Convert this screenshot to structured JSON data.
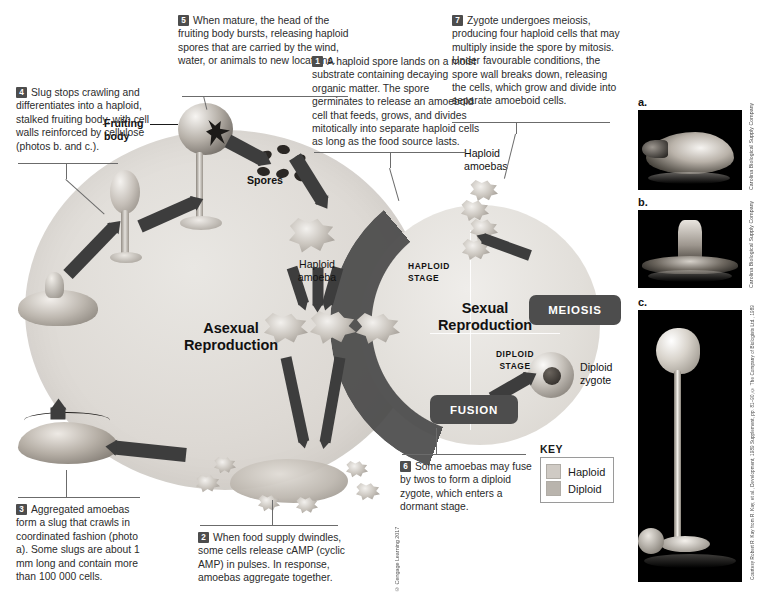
{
  "figure": {
    "asexual_label": "Asexual\nReproduction",
    "asexual_line1": "Asexual",
    "asexual_line2": "Reproduction",
    "sexual_line1": "Sexual",
    "sexual_line2": "Reproduction",
    "haploid_stage_line1": "HAPLOID",
    "haploid_stage_line2": "STAGE",
    "diploid_stage_line1": "DIPLOID",
    "diploid_stage_line2": "STAGE",
    "meiosis_pill": "MEIOSIS",
    "fusion_pill": "FUSION"
  },
  "labels": {
    "fruiting_body_line1": "Fruiting",
    "fruiting_body_line2": "body",
    "spores": "Spores",
    "haploid_amoeba_line1": "Haploid",
    "haploid_amoeba_line2": "amoeba",
    "haploid_amoebas_line1": "Haploid",
    "haploid_amoebas_line2": "amoebas",
    "diploid_zygote_line1": "Diploid",
    "diploid_zygote_line2": "zygote"
  },
  "steps": [
    {
      "number": "1",
      "text": "A haploid spore lands on a moist substrate containing decaying organic matter. The spore germinates to release an amoeboid cell that feeds, grows, and divides mitotically into separate haploid cells as long as the food source lasts."
    },
    {
      "number": "2",
      "text": "When food supply dwindles, some cells release cAMP (cyclic AMP) in pulses. In response, amoebas aggregate together."
    },
    {
      "number": "3",
      "text": "Aggregated amoebas form a slug that crawls in coordinated fashion (photo a). Some slugs are about 1 mm long and contain more than 100 000 cells."
    },
    {
      "number": "4",
      "text": "Slug stops crawling and differentiates into a haploid, stalked fruiting body, with cell walls reinforced by cellulose (photos b. and c.)."
    },
    {
      "number": "5",
      "text": "When mature, the head of the fruiting body bursts, releasing haploid spores that are carried by the wind, water, or animals to new locations."
    },
    {
      "number": "6",
      "text": "Some amoebas may fuse by twos to form a diploid zygote, which enters a dormant stage."
    },
    {
      "number": "7",
      "text": "Zygote undergoes meiosis, producing four haploid cells that may multiply inside the spore by mitosis. Under favourable conditions, the spore wall breaks down, releasing the cells, which grow and divide into separate amoeboid cells."
    }
  ],
  "key": {
    "title": "KEY",
    "entries": [
      {
        "label": "Haploid",
        "color": "#cfcac4"
      },
      {
        "label": "Diploid",
        "color": "#b9b4ad"
      }
    ]
  },
  "photos": [
    {
      "letter": "a.",
      "credit": "Carolina Biological Supply Company"
    },
    {
      "letter": "b.",
      "credit": "Carolina Biological Supply Company"
    },
    {
      "letter": "c.",
      "credit": "Courtesy Robert R. Kay from R. Kay, et al., Development, 1989 Supplement, pp. 81–90, © The Company of Biologists Ltd., 1989"
    }
  ],
  "copyright": "© Cengage Learning 2017",
  "colors": {
    "arrow": "#3d3d3d",
    "pill": "#4d4d4d",
    "cycle_bg": "#ddd9d4",
    "text": "#2b2b2b"
  }
}
